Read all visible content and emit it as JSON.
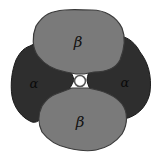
{
  "diagram": {
    "subunits": [
      {
        "id": "beta-top",
        "label": "β",
        "position": "top",
        "color": "#7a7a7a"
      },
      {
        "id": "alpha-left",
        "label": "α",
        "position": "left",
        "color": "#2e2e2e"
      },
      {
        "id": "alpha-right",
        "label": "α",
        "position": "right",
        "color": "#2e2e2e"
      },
      {
        "id": "beta-bottom",
        "label": "β",
        "position": "bottom",
        "color": "#7a7a7a"
      }
    ],
    "center": {
      "element": "central pore",
      "ring_color": "#555555",
      "background": "#ffffff"
    },
    "colors": {
      "beta_fill": "#7a7a7a",
      "beta_edge": "#3a3a3a",
      "alpha_fill": "#2e2e2e",
      "alpha_edge": "#1a1a1a",
      "background": "#ffffff"
    }
  }
}
